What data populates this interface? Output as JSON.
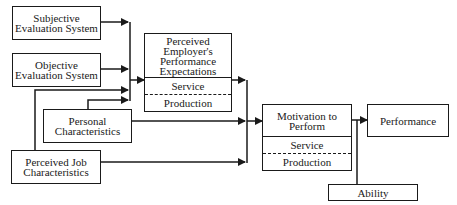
{
  "diagram": {
    "nodes": {
      "subjective": {
        "label": "Subjective Evaluation System"
      },
      "objective": {
        "label": "Objective Evaluation System"
      },
      "personal": {
        "label": "Personal Characteristics"
      },
      "job": {
        "label": "Perceived Job Characteristics"
      },
      "employer": {
        "label": "Perceived Employer's Performance Expectations",
        "sections": [
          "Service",
          "Production"
        ]
      },
      "motivation": {
        "label": "Motivation to Perform",
        "sections": [
          "Service",
          "Production"
        ]
      },
      "performance": {
        "label": "Performance"
      },
      "ability": {
        "label": "Ability"
      }
    },
    "edges": [
      {
        "from": "Subjective Evaluation System",
        "to": "Perceived Employer's Performance Expectations"
      },
      {
        "from": "Objective Evaluation System",
        "to": "Perceived Employer's Performance Expectations"
      },
      {
        "from": "Perceived Job Characteristics",
        "to": "Perceived Employer's Performance Expectations"
      },
      {
        "from": "Personal Characteristics",
        "to": "Perceived Employer's Performance Expectations"
      },
      {
        "from": "Perceived Employer's Performance Expectations",
        "to": "Motivation to Perform"
      },
      {
        "from": "Personal Characteristics",
        "to": "Motivation to Perform"
      },
      {
        "from": "Perceived Job Characteristics",
        "to": "Motivation to Perform"
      },
      {
        "from": "Motivation to Perform",
        "to": "Performance"
      },
      {
        "from": "Ability",
        "to": "Performance"
      }
    ]
  }
}
